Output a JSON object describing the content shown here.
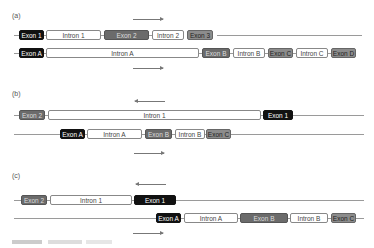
{
  "panels": [
    {
      "label": "(a)",
      "arrow_top": "right",
      "arrow_bottom": "right",
      "gene1": [
        "Exon 1",
        "Intron 1",
        "Exon 2",
        "Intron 2",
        "Exon 3"
      ],
      "gene2": [
        "Exon A",
        "Intron A",
        "Exon B",
        "Intron B",
        "Exon C",
        "Intron C",
        "Exon D"
      ]
    },
    {
      "label": "(b)",
      "arrow_top": "left",
      "arrow_bottom": "right",
      "gene1": [
        "Exon 2",
        "Intron 1",
        "Exon 1"
      ],
      "gene2": [
        "Exon A",
        "Intron A",
        "Exon B",
        "Intron B",
        "Exon C"
      ]
    },
    {
      "label": "(c)",
      "arrow_top": "left",
      "arrow_bottom": "right",
      "gene1": [
        "Exon 2",
        "Intron 1",
        "Exon 1"
      ],
      "gene2": [
        "Exon A",
        "Intron A",
        "Exon B",
        "Intron B",
        "Exon C"
      ]
    }
  ],
  "colors": {
    "exon_black": "#111111",
    "exon_dark": "#6b6b6b",
    "exon_mid": "#8c8c8c",
    "intron": "#ffffff",
    "line": "#9a9a9a"
  }
}
